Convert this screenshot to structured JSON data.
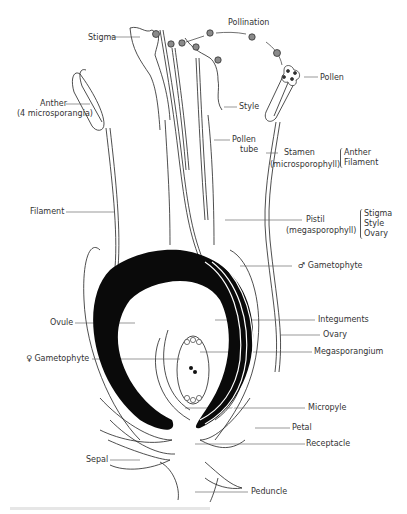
{
  "diagram": {
    "labels": {
      "pollination": "Pollination",
      "stigma": "Stigma",
      "pollen": "Pollen",
      "anther": "Anther",
      "anther_sub": "(4 microsporangia)",
      "style": "Style",
      "pollen_tube_1": "Pollen",
      "pollen_tube_2": "tube",
      "stamen": "Stamen",
      "stamen_sub": "(microsporophyll)",
      "filament": "Filament",
      "pistil": "Pistil",
      "pistil_sub": "(megasporophyll)",
      "male_gametophyte": "♂ Gametophyte",
      "ovule": "Ovule",
      "integuments": "Integuments",
      "ovary": "Ovary",
      "female_gametophyte": "♀ Gametophyte",
      "megasporangium": "Megasporangium",
      "micropyle": "Micropyle",
      "petal": "Petal",
      "receptacle": "Receptacle",
      "sepal": "Sepal",
      "peduncle": "Peduncle"
    },
    "stamen_parts": [
      "Anther",
      "Filament"
    ],
    "pistil_parts": [
      "Stigma",
      "Style",
      "Ovary"
    ],
    "colors": {
      "ink": "#222222",
      "fill_dark": "#0a0a0a",
      "label": "#333333"
    }
  }
}
